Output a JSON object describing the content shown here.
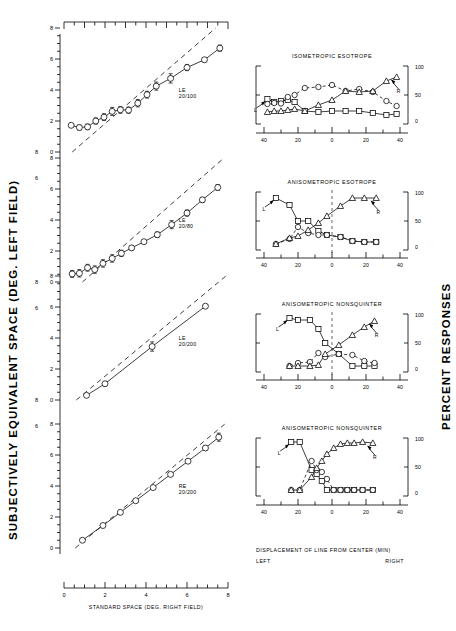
{
  "figure": {
    "left_axis_title": "SUBJECTIVELY EQUIVALENT SPACE (DEG. LEFT FIELD)",
    "right_axis_title": "PERCENT RESPONSES",
    "bottom_axis_title": "STANDARD SPACE (DEG. RIGHT FIELD)",
    "inset_caption_line1": "DISPLACEMENT OF LINE FROM CENTER (MIN)",
    "inset_caption_left": "LEFT",
    "inset_caption_right": "RIGHT"
  },
  "main_axis": {
    "x_ticks": [
      "0",
      "2",
      "4",
      "6",
      "8"
    ],
    "y_ticks": [
      "0",
      "2",
      "4",
      "6",
      "8"
    ],
    "xlim": [
      0,
      8
    ],
    "ylim": [
      0,
      8
    ]
  },
  "inset_axis": {
    "x_ticks": [
      "40",
      "20",
      "0",
      "20",
      "40"
    ],
    "y_ticks": [
      "0",
      "50",
      "100"
    ],
    "xlim": [
      -40,
      40
    ],
    "ylim": [
      0,
      100
    ],
    "left_marker": "L",
    "right_marker": "R"
  },
  "chart_data": [
    {
      "type": "scatter",
      "panel": 1,
      "title": "LE 20/100",
      "xlabel": "STANDARD SPACE (DEG. RIGHT FIELD)",
      "ylabel": "SUBJECTIVELY EQUIVALENT SPACE (DEG. LEFT FIELD)",
      "xlim": [
        0,
        8
      ],
      "ylim": [
        0,
        8
      ],
      "reference_line": {
        "style": "dashed",
        "x": [
          0.4,
          7.4
        ],
        "y": [
          0,
          8
        ]
      },
      "x": [
        0.35,
        0.75,
        1.15,
        1.55,
        1.95,
        2.35,
        2.75,
        3.15,
        3.6,
        4.05,
        4.5,
        5.2,
        6.0,
        6.85,
        7.6
      ],
      "y": [
        1.72,
        1.58,
        1.62,
        2.0,
        2.25,
        2.62,
        2.72,
        2.7,
        3.15,
        3.7,
        4.25,
        4.75,
        5.45,
        5.95,
        6.7
      ],
      "yerr": [
        0.1,
        0.16,
        0.18,
        0.2,
        0.22,
        0.26,
        0.22,
        0.2,
        0.24,
        0.22,
        0.26,
        0.3,
        0.2,
        0.14,
        0.2
      ]
    },
    {
      "type": "scatter",
      "panel": 2,
      "title": "LE 20/80",
      "xlim": [
        0,
        8
      ],
      "ylim": [
        0,
        8
      ],
      "reference_line": {
        "style": "dashed",
        "x": [
          0.9,
          7.8
        ],
        "y": [
          0,
          8
        ]
      },
      "x": [
        0.4,
        0.75,
        1.15,
        1.5,
        1.9,
        2.35,
        2.8,
        3.3,
        3.9,
        4.55,
        5.25,
        6.0,
        6.75,
        7.5
      ],
      "y": [
        0.52,
        0.56,
        0.92,
        0.8,
        1.2,
        1.52,
        1.85,
        2.2,
        2.6,
        3.05,
        3.7,
        4.45,
        5.3,
        6.1
      ],
      "yerr": [
        0.22,
        0.24,
        0.22,
        0.24,
        0.24,
        0.24,
        0.2,
        0.14,
        0.12,
        0.18,
        0.26,
        0.2,
        0.16,
        0.18
      ]
    },
    {
      "type": "scatter",
      "panel": 3,
      "title": "LE 20/200",
      "xlim": [
        0,
        8
      ],
      "ylim": [
        0,
        8
      ],
      "reference_line": {
        "style": "dashed",
        "x": [
          0.6,
          7.9
        ],
        "y": [
          0,
          8
        ]
      },
      "x": [
        1.1,
        2.0,
        4.3,
        6.9
      ],
      "y": [
        0.3,
        1.05,
        3.45,
        6.05
      ],
      "yerr": [
        0.1,
        0.14,
        0.3,
        0.1
      ]
    },
    {
      "type": "scatter",
      "panel": 4,
      "title": "RE 20/200",
      "xlim": [
        0,
        8
      ],
      "ylim": [
        0,
        8
      ],
      "reference_line": {
        "style": "dashed",
        "x": [
          0.55,
          7.85
        ],
        "y": [
          0,
          8
        ]
      },
      "x": [
        0.9,
        1.9,
        2.75,
        3.5,
        4.35,
        5.2,
        6.05,
        6.9,
        7.55
      ],
      "y": [
        0.5,
        1.45,
        2.3,
        3.05,
        3.9,
        4.75,
        5.6,
        6.45,
        7.15
      ],
      "yerr": [
        0.1,
        0.1,
        0.1,
        0.12,
        0.12,
        0.12,
        0.12,
        0.14,
        0.26
      ]
    },
    {
      "type": "line",
      "panel": "inset-1",
      "title": "ISOMETROPIC  ESOTROPE",
      "xlabel": "DISPLACEMENT OF LINE FROM CENTER (MIN)",
      "ylabel": "PERCENT RESPONSES",
      "xlim": [
        -40,
        40
      ],
      "ylim": [
        0,
        100
      ],
      "center_line": false,
      "series": [
        {
          "name": "square",
          "marker": "square",
          "linestyle": "solid",
          "x": [
            -38,
            -34,
            -30,
            -26,
            -22,
            -16,
            -8,
            0,
            8,
            16,
            24,
            32,
            38
          ],
          "y": [
            42,
            36,
            38,
            40,
            36,
            18,
            16,
            18,
            18,
            18,
            14,
            10,
            12
          ]
        },
        {
          "name": "circle",
          "marker": "circle",
          "linestyle": "dashed",
          "x": [
            -38,
            -34,
            -30,
            -26,
            -22,
            -16,
            -8,
            0,
            8,
            16,
            24,
            32,
            38
          ],
          "y": [
            32,
            34,
            33,
            46,
            50,
            64,
            66,
            70,
            58,
            62,
            56,
            38,
            28
          ]
        },
        {
          "name": "triangle",
          "marker": "triangle",
          "linestyle": "solid",
          "x": [
            -38,
            -34,
            -30,
            -26,
            -22,
            -16,
            -8,
            0,
            8,
            16,
            24,
            32,
            38
          ],
          "y": [
            16,
            18,
            18,
            20,
            22,
            18,
            30,
            40,
            58,
            56,
            58,
            78,
            86
          ]
        }
      ]
    },
    {
      "type": "line",
      "panel": "inset-2",
      "title": "ANISOMETROPIC  ESOTROPE",
      "xlim": [
        -40,
        40
      ],
      "ylim": [
        0,
        100
      ],
      "center_line": true,
      "series": [
        {
          "name": "square",
          "marker": "square",
          "linestyle": "solid",
          "x": [
            -33,
            -25,
            -20,
            -14,
            -8,
            -3,
            5,
            12,
            19,
            26
          ],
          "y": [
            96,
            82,
            50,
            50,
            30,
            22,
            18,
            10,
            8,
            8
          ]
        },
        {
          "name": "circle",
          "marker": "circle",
          "linestyle": "dashed",
          "x": [
            -33,
            -25,
            -20,
            -14,
            -8,
            -3,
            5,
            12,
            19,
            26
          ],
          "y": [
            4,
            14,
            38,
            26,
            22,
            22,
            18,
            10,
            8,
            8
          ]
        },
        {
          "name": "triangle",
          "marker": "triangle",
          "linestyle": "solid",
          "x": [
            -33,
            -25,
            -20,
            -14,
            -8,
            -3,
            5,
            12,
            19,
            26
          ],
          "y": [
            4,
            16,
            20,
            32,
            46,
            60,
            80,
            96,
            96,
            96
          ]
        }
      ]
    },
    {
      "type": "line",
      "panel": "inset-3",
      "title": "ANISOMETROPIC  NONSQUINTER",
      "xlim": [
        -40,
        40
      ],
      "ylim": [
        0,
        100
      ],
      "center_line": true,
      "series": [
        {
          "name": "square",
          "marker": "square",
          "linestyle": "solid",
          "x": [
            -25,
            -20,
            -13,
            -8,
            -4,
            4,
            12,
            19,
            25
          ],
          "y": [
            100,
            96,
            96,
            78,
            50,
            28,
            4,
            4,
            4
          ]
        },
        {
          "name": "circle",
          "marker": "circle",
          "linestyle": "dashed",
          "x": [
            -25,
            -20,
            -13,
            -8,
            -4,
            4,
            12,
            19,
            25
          ],
          "y": [
            4,
            10,
            12,
            30,
            22,
            28,
            26,
            14,
            10
          ]
        },
        {
          "name": "triangle",
          "marker": "triangle",
          "linestyle": "solid",
          "x": [
            -25,
            -20,
            -13,
            -8,
            -4,
            4,
            12,
            19,
            25
          ],
          "y": [
            4,
            4,
            4,
            6,
            28,
            46,
            66,
            82,
            94
          ]
        }
      ]
    },
    {
      "type": "line",
      "panel": "inset-4",
      "title": "ANISOMETROPIC  NONSQUINTER",
      "xlim": [
        -40,
        40
      ],
      "ylim": [
        0,
        100
      ],
      "center_line": false,
      "series": [
        {
          "name": "square",
          "marker": "square",
          "linestyle": "solid",
          "x": [
            -24,
            -19,
            -12,
            -9,
            -6,
            -3,
            1,
            5,
            9,
            13,
            18,
            24
          ],
          "y": [
            100,
            100,
            44,
            36,
            22,
            4,
            4,
            4,
            4,
            4,
            4,
            4
          ]
        },
        {
          "name": "circle",
          "marker": "circle",
          "linestyle": "dashed",
          "x": [
            -24,
            -19,
            -12,
            -9,
            -6,
            -3,
            1,
            5,
            9,
            13,
            18,
            24
          ],
          "y": [
            4,
            4,
            62,
            44,
            40,
            26,
            4,
            4,
            4,
            4,
            4,
            4
          ]
        },
        {
          "name": "triangle",
          "marker": "triangle",
          "linestyle": "solid",
          "x": [
            -24,
            -19,
            -12,
            -9,
            -6,
            -3,
            1,
            5,
            9,
            13,
            18,
            24
          ],
          "y": [
            4,
            4,
            30,
            48,
            62,
            76,
            88,
            96,
            98,
            98,
            100,
            98
          ]
        }
      ]
    }
  ]
}
